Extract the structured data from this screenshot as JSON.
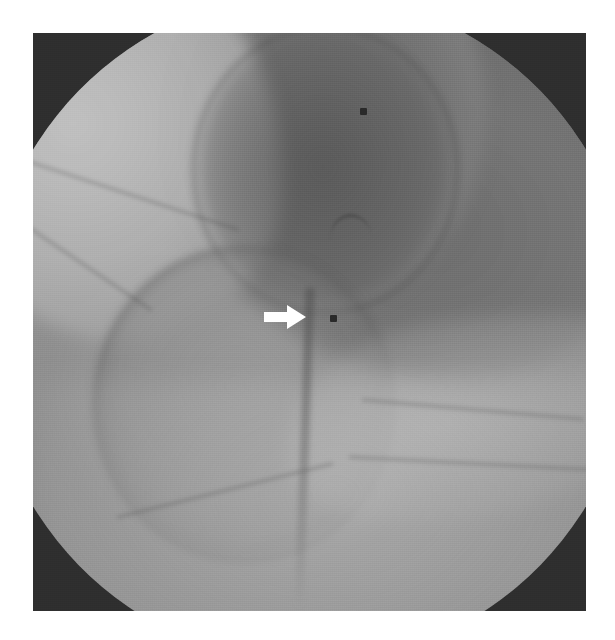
{
  "image": {
    "modality": "fluoroscopy",
    "kind": "grayscale-radiograph",
    "region": "hip-joint",
    "frame": {
      "x": 33,
      "y": 33,
      "width": 553,
      "height": 578
    },
    "page_background": "#ffffff",
    "vignette_color": "#2e2e2e",
    "field_color": "#8d8d8d",
    "caption": ""
  },
  "annotations": {
    "arrow": {
      "name": "white-arrow-marker",
      "direction": "right",
      "color": "#ffffff",
      "x": 263,
      "y": 303,
      "width": 44,
      "height": 28
    },
    "markers": [
      {
        "name": "radiopaque-marker-superior",
        "x": 360,
        "y": 108,
        "size": 7,
        "color": "#2a2a2a"
      },
      {
        "name": "radiopaque-marker-inferior",
        "x": 330,
        "y": 315,
        "size": 7,
        "color": "#2a2a2a"
      }
    ]
  },
  "features": {
    "needle_shaft": {
      "name": "vertical-needle-shaft",
      "visible": true
    },
    "femoral_head": {
      "name": "femoral-head-outline",
      "visible": true
    },
    "acetabular_fossa": {
      "name": "acetabular-fossa-outline",
      "visible": true
    },
    "iliac_wing": {
      "name": "iliac-wing-bright-region",
      "visible": true
    },
    "obturator_mass": {
      "name": "obturator-dense-region",
      "visible": true
    },
    "pubic_ramus": {
      "name": "pubic-ramus-band",
      "visible": true
    }
  }
}
